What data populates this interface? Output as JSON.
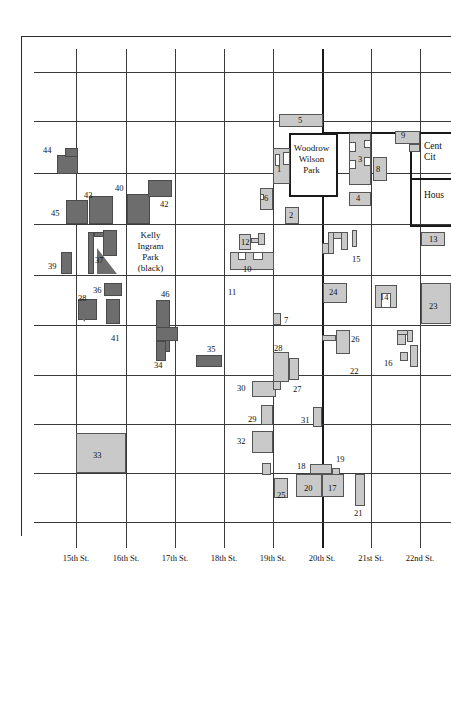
{
  "map": {
    "title": "Downtown Birmingham block map",
    "colors": {
      "light_building": "#c9c9c9",
      "dark_building": "#6d6d6d",
      "grid_line": "#3a3a3a",
      "major_grid_line": "#1a1a1a",
      "background": "#ffffff"
    },
    "street_labels": [
      {
        "name": "15th St.",
        "x": 76
      },
      {
        "name": "16th St.",
        "x": 126
      },
      {
        "name": "17th St.",
        "x": 175
      },
      {
        "name": "18th St.",
        "x": 224
      },
      {
        "name": "19th St.",
        "x": 273
      },
      {
        "name": "20th St.",
        "x": 322
      },
      {
        "name": "21st St.",
        "x": 371
      },
      {
        "name": "22nd St.",
        "x": 420
      }
    ],
    "place_labels": [
      {
        "id": "woodrow-wilson-park",
        "text": "Woodrow\nWilson\nPark",
        "x": 300,
        "y": 148,
        "w": 60
      },
      {
        "id": "kelly-ingram-park",
        "text": "Kelly\nIngram\nPark\n(black)",
        "x": 150,
        "y": 232,
        "w": 50
      },
      {
        "id": "central-city",
        "text": "Cent\nCit",
        "x": 424,
        "y": 142
      },
      {
        "id": "housing",
        "text": "Hous",
        "x": 424,
        "y": 192
      }
    ],
    "buildings": [
      {
        "n": "1",
        "tone": "light",
        "lx": 277,
        "ly": 170
      },
      {
        "n": "2",
        "tone": "light",
        "lx": 290,
        "ly": 213
      },
      {
        "n": "3",
        "tone": "light",
        "lx": 362,
        "ly": 157
      },
      {
        "n": "4",
        "tone": "light",
        "lx": 360,
        "ly": 199
      },
      {
        "n": "5",
        "tone": "light",
        "lx": 300,
        "ly": 121
      },
      {
        "n": "6",
        "tone": "light",
        "lx": 269,
        "ly": 198
      },
      {
        "n": "7",
        "tone": "light",
        "lx": 288,
        "ly": 320
      },
      {
        "n": "8",
        "tone": "light",
        "lx": 379,
        "ly": 168
      },
      {
        "n": "9",
        "tone": "light",
        "lx": 404,
        "ly": 135
      },
      {
        "n": "10",
        "tone": "light",
        "lx": 246,
        "ly": 270
      },
      {
        "n": "11",
        "tone": "none",
        "lx": 229,
        "ly": 290
      },
      {
        "n": "12",
        "tone": "light",
        "lx": 244,
        "ly": 242
      },
      {
        "n": "13",
        "tone": "light",
        "lx": 432,
        "ly": 240
      },
      {
        "n": "14",
        "tone": "light",
        "lx": 384,
        "ly": 296
      },
      {
        "n": "15",
        "tone": "light",
        "lx": 355,
        "ly": 259
      },
      {
        "n": "16",
        "tone": "light",
        "lx": 387,
        "ly": 363
      },
      {
        "n": "17",
        "tone": "light",
        "lx": 331,
        "ly": 492
      },
      {
        "n": "18",
        "tone": "light",
        "lx": 301,
        "ly": 467
      },
      {
        "n": "19",
        "tone": "light",
        "lx": 339,
        "ly": 459
      },
      {
        "n": "20",
        "tone": "light",
        "lx": 310,
        "ly": 492
      },
      {
        "n": "21",
        "tone": "light",
        "lx": 358,
        "ly": 515
      },
      {
        "n": "22",
        "tone": "none",
        "lx": 354,
        "ly": 371
      },
      {
        "n": "23",
        "tone": "light",
        "lx": 432,
        "ly": 307
      },
      {
        "n": "24",
        "tone": "light",
        "lx": 332,
        "ly": 292
      },
      {
        "n": "25",
        "tone": "light",
        "lx": 285,
        "ly": 495
      },
      {
        "n": "26",
        "tone": "light",
        "lx": 353,
        "ly": 340
      },
      {
        "n": "27",
        "tone": "light",
        "lx": 297,
        "ly": 389
      },
      {
        "n": "28",
        "tone": "light",
        "lx": 278,
        "ly": 347
      },
      {
        "n": "29",
        "tone": "light",
        "lx": 252,
        "ly": 419
      },
      {
        "n": "30",
        "tone": "light",
        "lx": 241,
        "ly": 388
      },
      {
        "n": "31",
        "tone": "light",
        "lx": 305,
        "ly": 420
      },
      {
        "n": "32",
        "tone": "light",
        "lx": 241,
        "ly": 441
      },
      {
        "n": "33",
        "tone": "light",
        "lx": 96,
        "ly": 456
      },
      {
        "n": "34",
        "tone": "dark",
        "lx": 158,
        "ly": 365
      },
      {
        "n": "35",
        "tone": "dark",
        "lx": 211,
        "ly": 348
      },
      {
        "n": "36",
        "tone": "dark",
        "lx": 97,
        "ly": 290
      },
      {
        "n": "37",
        "tone": "dark",
        "lx": 99,
        "ly": 259
      },
      {
        "n": "38",
        "tone": "dark",
        "lx": 83,
        "ly": 298
      },
      {
        "n": "39",
        "tone": "dark",
        "lx": 52,
        "ly": 266
      },
      {
        "n": "40",
        "tone": "dark",
        "lx": 119,
        "ly": 188
      },
      {
        "n": "41",
        "tone": "none",
        "lx": 115,
        "ly": 338
      },
      {
        "n": "42",
        "tone": "dark",
        "lx": 164,
        "ly": 204
      },
      {
        "n": "43",
        "tone": "dark",
        "lx": 88,
        "ly": 199
      },
      {
        "n": "44",
        "tone": "dark",
        "lx": 47,
        "ly": 150
      },
      {
        "n": "45",
        "tone": "dark",
        "lx": 55,
        "ly": 213
      },
      {
        "n": "46",
        "tone": "dark",
        "lx": 165,
        "ly": 294
      }
    ]
  }
}
